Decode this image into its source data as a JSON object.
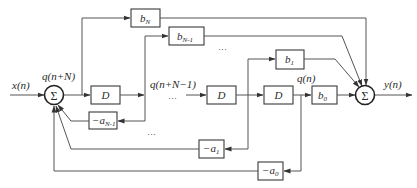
{
  "diagram": {
    "type": "direct-form-II-transposed-like filter block diagram",
    "colors": {
      "line": "#555555",
      "box": "#3a3a3a",
      "background": "#ffffff"
    },
    "signals": {
      "input": "x(n)",
      "output": "y(n)",
      "state_top": "q(n+N)",
      "state_mid": "q(n+N−1)",
      "state_last": "q(n)"
    },
    "sums": {
      "left": "Σ",
      "right": "Σ"
    },
    "delays": [
      "D",
      "D",
      "D"
    ],
    "forward_gains": [
      {
        "base": "b",
        "sub": "N"
      },
      {
        "base": "b",
        "sub": "N-1"
      },
      {
        "base": "b",
        "sub": "1"
      },
      {
        "base": "b",
        "sub": "0"
      }
    ],
    "feedback_gains": [
      {
        "base": "−a",
        "sub": "N-1"
      },
      {
        "base": "−a",
        "sub": "1"
      },
      {
        "base": "−a",
        "sub": "0"
      }
    ],
    "ellipses": [
      "…",
      "…",
      "…"
    ]
  }
}
